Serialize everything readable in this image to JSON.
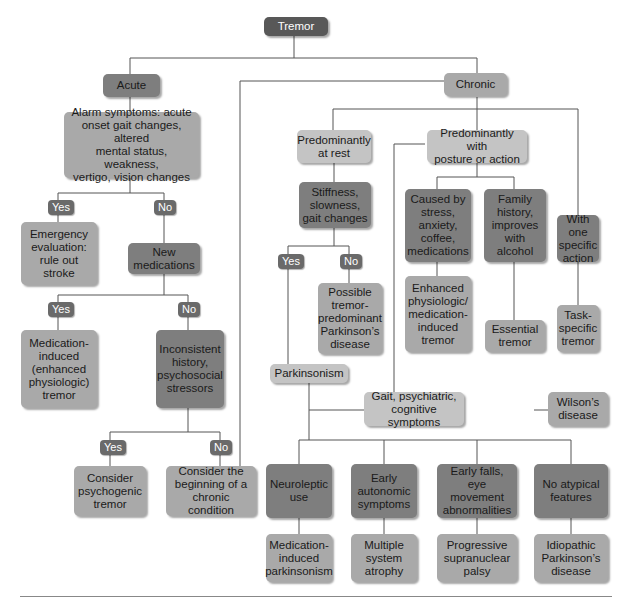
{
  "diagram": {
    "title": "Tremor",
    "nodes": {
      "tremor": "Tremor",
      "acute": "Acute",
      "chronic": "Chronic",
      "alarm": "Alarm symptoms: acute\nonset gait changes, altered\nmental status, weakness,\nvertigo, vision changes",
      "emergency": "Emergency\nevaluation:\nrule out stroke",
      "new_meds": "New\nmedications",
      "med_induced_tremor": "Medication-\ninduced\n(enhanced\nphysiologic)\ntremor",
      "inconsistent": "Inconsistent\nhistory,\npsychosocial\nstressors",
      "psychogenic": "Consider\npsychogenic\ntremor",
      "beginning_chronic": "Consider the\nbeginning of a\nchronic condition",
      "at_rest": "Predominantly\nat rest",
      "posture_action": "Predominantly with\nposture or action",
      "stiffness": "Stiffness,\nslowness,\ngait changes",
      "possible_pd": "Possible\ntremor-\npredominant\nParkinson’s\ndisease",
      "parkinsonism": "Parkinsonism",
      "caused_by_stress": "Caused by\nstress,\nanxiety,\ncoffee,\nmedications",
      "family_history": "Family\nhistory,\nimproves\nwith alcohol",
      "one_action": "With one\nspecific\naction",
      "enhanced_physiologic": "Enhanced\nphysiologic/\nmedication-\ninduced\ntremor",
      "essential": "Essential\ntremor",
      "task_specific": "Task-\nspecific\ntremor",
      "gait_psych": "Gait, psychiatric,\ncognitive symptoms",
      "wilsons": "Wilson’s\ndisease",
      "neuroleptic": "Neuroleptic\nuse",
      "autonomic": "Early\nautonomic\nsymptoms",
      "early_falls": "Early falls,\neye movement\nabnormalities",
      "no_atypical": "No atypical\nfeatures",
      "med_parkinsonism": "Medication-\ninduced\nparkinsonism",
      "msa": "Multiple\nsystem\natrophy",
      "psp": "Progressive\nsupranuclear\npalsy",
      "idiopathic_pd": "Idiopathic\nParkinson’s\ndisease"
    },
    "tags": {
      "yes": "Yes",
      "no": "No"
    }
  }
}
